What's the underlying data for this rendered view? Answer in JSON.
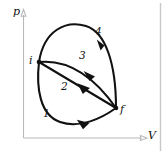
{
  "figure": {
    "type": "pressure-volume-diagram",
    "axes": {
      "y_label": "p",
      "x_label": "V"
    },
    "states": [
      {
        "id": "i",
        "label": "i",
        "role": "initial-state"
      },
      {
        "id": "f",
        "label": "f",
        "role": "final-state"
      }
    ],
    "paths": [
      {
        "id": "1",
        "label": "1",
        "from": "i",
        "to": "f",
        "shape": "lower-concave-curve"
      },
      {
        "id": "2",
        "label": "2",
        "from": "i",
        "to": "f",
        "shape": "straight-line"
      },
      {
        "id": "3",
        "label": "3",
        "from": "i",
        "to": "f",
        "shape": "upper-bulging-curve"
      },
      {
        "id": "4",
        "label": "4",
        "from": "i",
        "to": "f",
        "shape": "outermost-arched-curve"
      }
    ],
    "colors": {
      "curve": "#111111",
      "axis": "#b9b9b9",
      "frame": "#c8c8c8",
      "background": "#ffffff"
    }
  }
}
